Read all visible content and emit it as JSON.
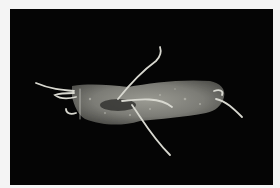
{
  "image": {
    "subject": "pale elongated specimen with thin curling tendrils on black background",
    "colors": {
      "frame": "#f4f4f4",
      "background": "#050505",
      "body": "#8a8a84",
      "body_shadow": "#4a4a46",
      "tendril": "#d8d8d0"
    }
  }
}
